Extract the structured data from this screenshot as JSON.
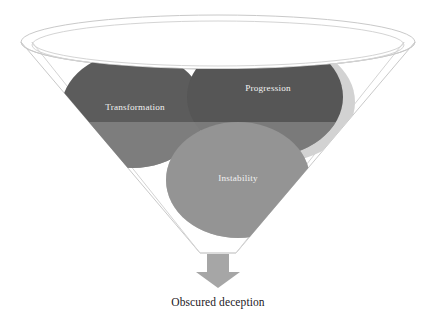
{
  "diagram": {
    "type": "funnel-venn",
    "background_color": "#ffffff",
    "title": "",
    "funnel": {
      "name": "funnel-container",
      "stroke_color": "#c9c9c9",
      "rim_inner_stroke_color": "#d4d4d4",
      "fill_color": "none",
      "rim_center_x": 218,
      "rim_center_y": 42,
      "rim_radius_x": 197,
      "rim_radius_y": 27,
      "inner_rim_radius_x": 186,
      "inner_rim_radius_y": 24,
      "neck_y": 253,
      "neck_half_width": 18
    },
    "fill_level": {
      "name": "contents-fill-level",
      "y": 122,
      "overlay_color": "#9a9a9a",
      "overlay_opacity": 0.55
    },
    "nodes": [
      {
        "id": "transformation",
        "label": "Transformation",
        "name": "ellipse-transformation",
        "cx": 133,
        "cy": 110,
        "rx": 72,
        "ry": 58,
        "fill_color": "#5c5c5c",
        "label_x": 135,
        "label_y": 110,
        "label_color": "#f2f2f2",
        "has_shadow": false
      },
      {
        "id": "progression",
        "label": "Progression",
        "name": "ellipse-progression",
        "cx": 265,
        "cy": 97,
        "rx": 78,
        "ry": 60,
        "fill_color": "#565656",
        "label_x": 268,
        "label_y": 91,
        "label_color": "#f2f2f2",
        "has_shadow": true,
        "shadow_color": "#d2d2d2",
        "shadow_dx": 12,
        "shadow_dy": 5
      },
      {
        "id": "instability",
        "label": "Instability",
        "name": "ellipse-instability",
        "cx": 238,
        "cy": 180,
        "rx": 72,
        "ry": 58,
        "fill_color": "#8f8f8f",
        "label_x": 238,
        "label_y": 181,
        "label_color": "#f4f4f4",
        "has_shadow": false
      }
    ],
    "arrow": {
      "name": "output-arrow",
      "label": "",
      "fill_color": "#a6a6a6",
      "shaft_left_x": 207,
      "shaft_right_x": 229,
      "shaft_top_y": 254,
      "shaft_bottom_y": 272,
      "head_left_x": 196,
      "head_right_x": 240,
      "head_tip_y": 288,
      "direction": "down"
    },
    "caption": {
      "name": "output-caption",
      "text": "Obscured deception",
      "x": 218,
      "y": 306,
      "color": "#23201e"
    }
  }
}
